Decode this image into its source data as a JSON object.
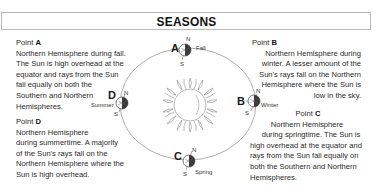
{
  "header": {
    "title": "SEASONS"
  },
  "points": {
    "A": {
      "label_prefix": "Point ",
      "letter": "A",
      "season": "Fall",
      "lines": [
        "Northern Hemisphere during fall.",
        "The Sun is high overhead at the",
        "equator and rays from the Sun",
        "fall equally on both the",
        "Southern and Northern",
        "Hemispheres."
      ]
    },
    "B": {
      "label_prefix": "Point ",
      "letter": "B",
      "season": "Winter",
      "lines": [
        "Northern Hemisphere during",
        "winter. A lesser amount of the",
        "Sun's rays fall on the Northern",
        "Hemisphere where the Sun is",
        "low in the sky."
      ]
    },
    "C": {
      "label_prefix": "Point ",
      "letter": "C",
      "season": "Spring",
      "lines": [
        "Northern Hemisphere",
        "during springtime. The Sun is",
        "high overhead at the equator and",
        "rays from the Sun fall equally on",
        "both the Southern and Northern",
        "Hemispheres."
      ]
    },
    "D": {
      "label_prefix": "Point ",
      "letter": "D",
      "season": "Summer",
      "lines": [
        "Northern Hemisphere",
        "during summertime. A majority",
        "of the Sun's rays fall on the",
        "Northern Hemisphere where the",
        "Sun is high overhead."
      ]
    }
  },
  "axis_labels": {
    "north": "N",
    "south": "S"
  },
  "icons": {
    "sun": "sun-icon",
    "earth": "earth-globe-icon",
    "orbit": "orbit-ellipse"
  },
  "colors": {
    "orbit": "#9a9a9a",
    "earth_dark": "#3a3a3a",
    "text": "#2a2a2a",
    "header_border": "#b8b8b8"
  }
}
